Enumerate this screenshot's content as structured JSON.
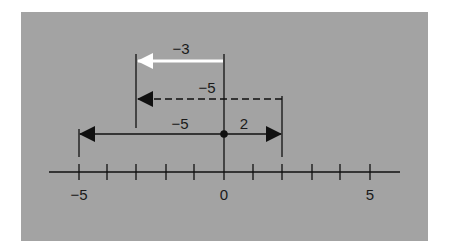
{
  "diagram": {
    "type": "number-line",
    "axis": {
      "min": -5,
      "max": 5,
      "tick_labels": [
        {
          "value": -5,
          "label": "−5"
        },
        {
          "value": 0,
          "label": "0"
        },
        {
          "value": 5,
          "label": "5"
        }
      ],
      "ticks": [
        -5,
        -4,
        -3,
        -2,
        -1,
        0,
        1,
        2,
        3,
        4,
        5
      ]
    },
    "arrows": [
      {
        "id": "start-to-2",
        "from": 0,
        "to": 2,
        "label": "2",
        "style": "solid",
        "color": "#111111"
      },
      {
        "id": "start-to-neg5",
        "from": 0,
        "to": -5,
        "label": "−5",
        "style": "solid",
        "color": "#111111"
      },
      {
        "id": "dashed-neg5",
        "from": 2,
        "to": -3,
        "label": "−5",
        "style": "dashed",
        "color": "#111111"
      },
      {
        "id": "result-neg3",
        "from": 0,
        "to": -3,
        "label": "−3",
        "style": "solid",
        "color": "#ffffff"
      }
    ],
    "origin_point": {
      "value": 0
    }
  },
  "colors": {
    "panel": "#a3a3a3",
    "ink": "#111111",
    "result_arrow": "#ffffff"
  }
}
